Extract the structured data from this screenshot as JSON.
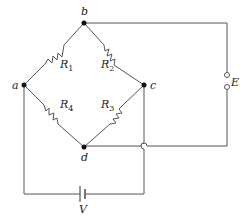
{
  "diagram": {
    "type": "wheatstone-bridge-circuit",
    "nodes": {
      "a": "a",
      "b": "b",
      "c": "c",
      "d": "d"
    },
    "resistors": [
      {
        "name": "R",
        "sub": "1",
        "between": "a-b"
      },
      {
        "name": "R",
        "sub": "2",
        "between": "b-c"
      },
      {
        "name": "R",
        "sub": "3",
        "between": "c-d"
      },
      {
        "name": "R",
        "sub": "4",
        "between": "a-d"
      }
    ],
    "output_terminal_label": "E",
    "source_label": "V",
    "colors": {
      "wire": "#555555",
      "node": "#111111",
      "text": "#222222"
    }
  }
}
